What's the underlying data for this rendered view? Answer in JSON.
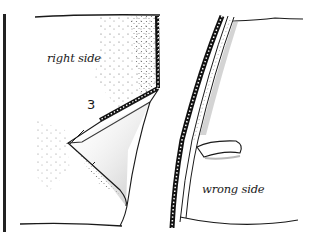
{
  "figure": {
    "type": "sewing-seam-illustration",
    "labels": {
      "right_side": "right side",
      "wrong_side": "wrong side",
      "step_marker": "3"
    },
    "colors": {
      "ink": "#1a1a1a",
      "paper": "#ffffff",
      "stipple": "#555555"
    }
  }
}
